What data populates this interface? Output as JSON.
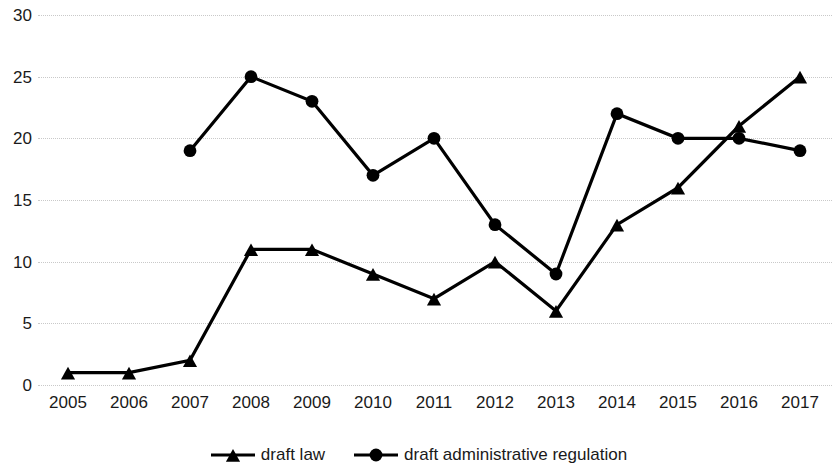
{
  "chart_data": {
    "type": "line",
    "title": "",
    "subtitle": "",
    "xlabel": "",
    "ylabel": "",
    "categories": [
      "2005",
      "2006",
      "2007",
      "2008",
      "2009",
      "2010",
      "2011",
      "2012",
      "2013",
      "2014",
      "2015",
      "2016",
      "2017"
    ],
    "series": [
      {
        "name": "draft law",
        "marker": "triangle",
        "color": "#000000",
        "values": [
          1,
          1,
          2,
          11,
          11,
          9,
          7,
          10,
          6,
          13,
          16,
          21,
          25
        ]
      },
      {
        "name": "draft administrative regulation",
        "marker": "circle",
        "color": "#000000",
        "values": [
          null,
          null,
          19,
          25,
          23,
          17,
          20,
          13,
          9,
          22,
          20,
          20,
          19
        ]
      }
    ],
    "ylim": [
      0,
      30
    ],
    "ytick_values": [
      0,
      5,
      10,
      15,
      20,
      25,
      30
    ],
    "ytick_labels": [
      "0",
      "5",
      "10",
      "15",
      "20",
      "25",
      "30"
    ],
    "grid": true,
    "grid_style": "dotted",
    "grid_color": "#c9c9c9",
    "legend_position": "bottom",
    "background": "#ffffff",
    "axis_text_color": "#1a1a1a"
  }
}
